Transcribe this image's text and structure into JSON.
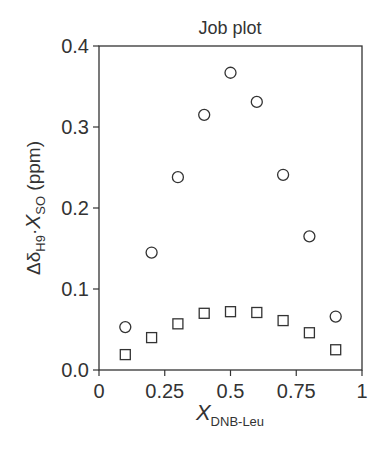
{
  "chart_data": {
    "type": "scatter",
    "title": "Job plot",
    "xlabel": "X_DNB-Leu",
    "ylabel": "Δδ_H9·X_SO (ppm)",
    "xlim": [
      0,
      1
    ],
    "ylim": [
      0,
      0.4
    ],
    "grid": false,
    "legend": null,
    "x_ticks": [
      "0",
      "0.25",
      "0.5",
      "0.75",
      "1"
    ],
    "y_ticks": [
      "0.0",
      "0.1",
      "0.2",
      "0.3",
      "0.4"
    ],
    "x": [
      0.1,
      0.2,
      0.3,
      0.4,
      0.5,
      0.6,
      0.7,
      0.8,
      0.9
    ],
    "series": [
      {
        "name": "circles",
        "marker": "open-circle",
        "values": [
          0.053,
          0.145,
          0.238,
          0.315,
          0.367,
          0.331,
          0.241,
          0.165,
          0.066
        ]
      },
      {
        "name": "squares",
        "marker": "open-square",
        "values": [
          0.019,
          0.04,
          0.057,
          0.07,
          0.072,
          0.071,
          0.061,
          0.046,
          0.025
        ]
      }
    ]
  },
  "labels": {
    "title": "Job plot",
    "xlabel_main": "X",
    "xlabel_sub": "DNB-Leu",
    "ylabel_delta": "Δδ",
    "ylabel_sub1": "H9",
    "ylabel_dot": "·",
    "ylabel_x": "X",
    "ylabel_sub2": "SO",
    "ylabel_unit": " (ppm)"
  },
  "colors": {
    "ink": "#333333",
    "background": "#ffffff"
  }
}
